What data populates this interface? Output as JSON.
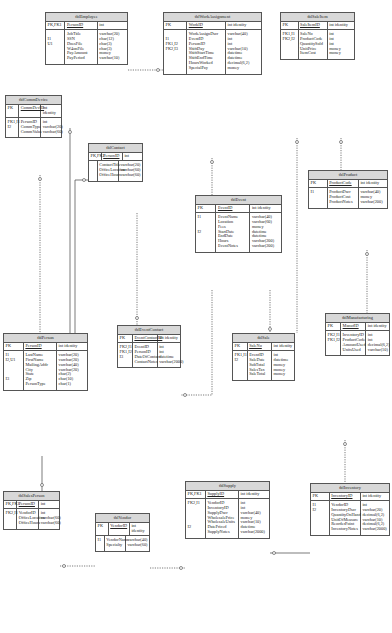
{
  "diagram": {
    "type": "entity-relationship",
    "tables": [
      {
        "id": "tblEmployee",
        "title": "tblEmployee",
        "pk_label": "PK,FK1",
        "pk_name": "PersonID",
        "pk_type": "int",
        "keys": [
          "",
          "I1",
          "U1",
          "",
          "",
          ""
        ],
        "fields": [
          "JobTitle",
          "SSN",
          "DoesFile",
          "W4onFile",
          "PayAmount",
          "PayPeriod"
        ],
        "types": [
          "varchar(20)",
          "char(12)",
          "char(3)",
          "char(3)",
          "money",
          "varchar(10)"
        ]
      },
      {
        "id": "tblWorkAssignment",
        "title": "tblWorkAssignment",
        "pk_label": "PK",
        "pk_name": "WorkID",
        "pk_type": "int identity",
        "keys": [
          "",
          "I1",
          "FK1,I2",
          "FK2,I3",
          "",
          "",
          "",
          "",
          ""
        ],
        "fields": [
          "WorkAssignDscr",
          "EventID",
          "PersonID",
          "ShiftDay",
          "ShiftStartTime",
          "ShiftEndTime",
          "HoursWorked",
          "SpecialPay"
        ],
        "types": [
          "varchar(40)",
          "int",
          "int",
          "varchar(10)",
          "datetime",
          "datetime",
          "decimal(6,2)",
          "money"
        ]
      },
      {
        "id": "tblSaleItem",
        "title": "tblSaleItem",
        "pk_label": "PK",
        "pk_name": "SaleItemID",
        "pk_type": "int identity",
        "keys": [
          "FK1,I1",
          "FK2,I2",
          "",
          "",
          ""
        ],
        "fields": [
          "SaleNo",
          "ProductCode",
          "QuantitySold",
          "UnitPrice",
          "ItemCost"
        ],
        "types": [
          "int",
          "int",
          "int",
          "money",
          "money"
        ]
      },
      {
        "id": "tblCommDevice",
        "title": "tblCommDevice",
        "pk_label": "PK",
        "pk_name": "CommDevID",
        "pk_type": "int identity",
        "keys": [
          "FK1,I1",
          "I2",
          ""
        ],
        "fields": [
          "PersonID",
          "CommType",
          "CommValue"
        ],
        "types": [
          "int",
          "varchar(20)",
          "varchar(60)"
        ]
      },
      {
        "id": "tblContact",
        "title": "tblContact",
        "pk_label": "PK,FK1",
        "pk_name": "PersonID",
        "pk_type": "int",
        "keys": [
          "",
          "",
          ""
        ],
        "fields": [
          "ContactTitle",
          "OfficeLocation",
          "OfficeHours"
        ],
        "types": [
          "varchar(20)",
          "varchar(60)",
          "varchar(60)"
        ]
      },
      {
        "id": "tblEvent",
        "title": "tblEvent",
        "pk_label": "PK",
        "pk_name": "EventID",
        "pk_type": "int identity",
        "keys": [
          "I1",
          "",
          "",
          "I2",
          "",
          "",
          ""
        ],
        "fields": [
          "EventName",
          "Location",
          "Fees",
          "StartDate",
          "EndDate",
          "Hours",
          "EventNotes"
        ],
        "types": [
          "varchar(40)",
          "varchar(60)",
          "money",
          "datetime",
          "datetime",
          "varchar(200)",
          "varchar(200)"
        ]
      },
      {
        "id": "tblProduct",
        "title": "tblProduct",
        "pk_label": "PK",
        "pk_name": "ProductCode",
        "pk_type": "int identity",
        "keys": [
          "I1",
          "",
          ""
        ],
        "fields": [
          "ProductDscr",
          "ProductCost",
          "ProductNotes"
        ],
        "types": [
          "varchar(40)",
          "money",
          "varchar(200)"
        ]
      },
      {
        "id": "tblPerson",
        "title": "tblPerson",
        "pk_label": "PK",
        "pk_name": "PersonID",
        "pk_type": "int identity",
        "keys": [
          "I1",
          "I2,U1",
          "",
          "",
          "",
          "I3",
          "",
          ""
        ],
        "fields": [
          "LastName",
          "FirstName",
          "MailingAddr",
          "City",
          "State",
          "Zip",
          "PersonType"
        ],
        "types": [
          "varchar(20)",
          "varchar(20)",
          "varchar(40)",
          "varchar(20)",
          "char(2)",
          "char(10)",
          "char(1)"
        ]
      },
      {
        "id": "tblEventContact",
        "title": "tblEventContact",
        "pk_label": "PK",
        "pk_name": "EventContactID",
        "pk_type": "int identity",
        "keys": [
          "FK2,I1",
          "FK1,I2",
          "I3",
          ""
        ],
        "fields": [
          "EventID",
          "PersonID",
          "DateOfContact",
          "ContactNotes"
        ],
        "types": [
          "int",
          "int",
          "datetime",
          "varchar(2000)"
        ]
      },
      {
        "id": "tblSale",
        "title": "tblSale",
        "pk_label": "PK",
        "pk_name": "SaleNo",
        "pk_type": "int identity",
        "keys": [
          "FK1,I1",
          "I2",
          "",
          "",
          ""
        ],
        "fields": [
          "EventID",
          "SaleDate",
          "SubTotal",
          "SalesTax",
          "SaleTotal"
        ],
        "types": [
          "int",
          "datetime",
          "money",
          "money",
          "money"
        ]
      },
      {
        "id": "tblManufacturing",
        "title": "tblManufacturing",
        "pk_label": "PK",
        "pk_name": "ManufID",
        "pk_type": "int identity",
        "keys": [
          "FK2,I1",
          "FK1,I2",
          "",
          ""
        ],
        "fields": [
          "InventoryID",
          "ProductCode",
          "AmountUsed",
          "UnitsUsed"
        ],
        "types": [
          "int",
          "int",
          "decimal(6,2)",
          "varchar(10)"
        ]
      },
      {
        "id": "tblSalesPerson",
        "title": "tblSalesPerson",
        "pk_label": "PK,FK1",
        "pk_name": "PersonID",
        "pk_type": "int",
        "keys": [
          "FK2,I1",
          "",
          ""
        ],
        "fields": [
          "VendorID",
          "OfficeLocation",
          "OfficeHours"
        ],
        "types": [
          "int",
          "varchar(60)",
          "varchar(60)"
        ]
      },
      {
        "id": "tblVendor",
        "title": "tblVendor",
        "pk_label": "PK",
        "pk_name": "VendorID",
        "pk_type": "int identity",
        "keys": [
          "I1",
          ""
        ],
        "fields": [
          "VendorName",
          "Specialty"
        ],
        "types": [
          "varchar(40)",
          "varchar(60)"
        ]
      },
      {
        "id": "tblSupply",
        "title": "tblSupply",
        "pk_label": "PK,FK1",
        "pk_name": "SupplyID",
        "pk_type": "int identity",
        "keys": [
          "FK2,I1",
          "",
          "",
          "",
          "",
          "I2",
          ""
        ],
        "fields": [
          "VendorID",
          "InventoryID",
          "SupplyDscr",
          "WholesalePrice",
          "WholesaleUnits",
          "DatePriced",
          "SupplyNotes"
        ],
        "types": [
          "int",
          "int",
          "varchar(40)",
          "money",
          "varchar(10)",
          "datetime",
          "varchar(2000)"
        ]
      },
      {
        "id": "tblInventory",
        "title": "tblInventory",
        "pk_label": "PK",
        "pk_name": "InventoryID",
        "pk_type": "int identity",
        "keys": [
          "I1",
          "I2",
          "",
          "",
          "",
          ""
        ],
        "fields": [
          "VendorID",
          "InventoryDscr",
          "QuantityOnHand",
          "UnitOfMeasure",
          "ReorderPoint",
          "InventoryNotes"
        ],
        "types": [
          "int",
          "varchar(20)",
          "decimal(6,2)",
          "varchar(10)",
          "decimal(6,2)",
          "varchar(2000)"
        ]
      }
    ],
    "relationships": [
      {
        "from": "tblEmployee",
        "to": "tblWorkAssignment",
        "style": "dotted"
      },
      {
        "from": "tblEmployee",
        "to": "tblPerson",
        "style": "solid"
      },
      {
        "from": "tblWorkAssignment",
        "to": "tblEvent",
        "style": "dotted"
      },
      {
        "from": "tblSaleItem",
        "to": "tblProduct",
        "style": "dotted"
      },
      {
        "from": "tblSaleItem",
        "to": "tblSale",
        "style": "dotted"
      },
      {
        "from": "tblCommDevice",
        "to": "tblPerson",
        "style": "dotted"
      },
      {
        "from": "tblContact",
        "to": "tblPerson",
        "style": "solid"
      },
      {
        "from": "tblEvent",
        "to": "tblEventContact",
        "style": "dotted"
      },
      {
        "from": "tblEvent",
        "to": "tblSale",
        "style": "dotted"
      },
      {
        "from": "tblProduct",
        "to": "tblManufacturing",
        "style": "dotted"
      },
      {
        "from": "tblPerson",
        "to": "tblSalesPerson",
        "style": "solid"
      },
      {
        "from": "tblSalesPerson",
        "to": "tblVendor",
        "style": "dotted"
      },
      {
        "from": "tblVendor",
        "to": "tblSupply",
        "style": "dotted"
      },
      {
        "from": "tblSupply",
        "to": "tblInventory",
        "style": "solid"
      },
      {
        "from": "tblInventory",
        "to": "tblManufacturing",
        "style": "dotted"
      }
    ]
  }
}
